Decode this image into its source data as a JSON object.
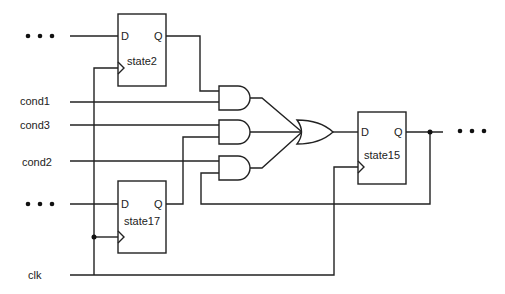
{
  "diagram": {
    "type": "sequential logic circuit",
    "inputs": {
      "cond1": "cond1",
      "cond3": "cond3",
      "cond2": "cond2",
      "clk": "clk"
    },
    "ellipsis": "• • •",
    "flipflops": {
      "state2": {
        "name": "state2",
        "d_pin": "D",
        "q_pin": "Q"
      },
      "state17": {
        "name": "state17",
        "d_pin": "D",
        "q_pin": "Q"
      },
      "state15": {
        "name": "state15",
        "d_pin": "D",
        "q_pin": "Q"
      }
    },
    "gates": [
      {
        "id": "and1",
        "type": "AND",
        "inputs": [
          "state2.Q",
          "cond1"
        ]
      },
      {
        "id": "and2",
        "type": "AND",
        "inputs": [
          "cond3",
          "state17.Q"
        ]
      },
      {
        "id": "and3",
        "type": "AND",
        "inputs": [
          "cond2",
          "state15.Q"
        ]
      },
      {
        "id": "or1",
        "type": "OR",
        "inputs": [
          "and1",
          "and2",
          "and3"
        ],
        "output": "state15.D"
      }
    ],
    "colors": {
      "line": "#222222",
      "background": "#ffffff"
    }
  }
}
